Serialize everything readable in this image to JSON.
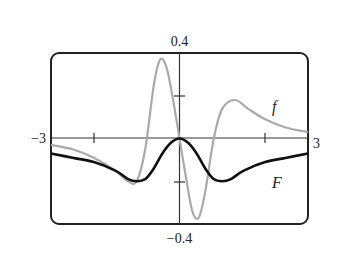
{
  "chart_data": {
    "type": "line",
    "title": "",
    "xlabel": "",
    "ylabel": "",
    "xlim": [
      -3,
      3
    ],
    "ylim": [
      -0.4,
      0.4
    ],
    "x_tick_labels": [
      "-3",
      "3"
    ],
    "y_tick_labels": [
      "0.4",
      "-0.4"
    ],
    "x_ticks": [
      -2,
      2
    ],
    "y_ticks": [
      -0.2,
      0.2
    ],
    "grid": false,
    "legend": "inline labels",
    "series": [
      {
        "name": "f",
        "color": "#aaaaaa",
        "x": [
          -3,
          -2.5,
          -2,
          -1.5,
          -1.2,
          -1,
          -0.8,
          -0.6,
          -0.45,
          -0.3,
          -0.15,
          0,
          0.15,
          0.3,
          0.45,
          0.6,
          0.8,
          1.0,
          1.3,
          1.6,
          2.0,
          2.5,
          3
        ],
        "values": [
          -0.03,
          -0.05,
          -0.09,
          -0.15,
          -0.2,
          -0.2,
          -0.05,
          0.25,
          0.37,
          0.33,
          0.18,
          0,
          -0.18,
          -0.34,
          -0.37,
          -0.25,
          0.0,
          0.14,
          0.18,
          0.14,
          0.09,
          0.05,
          0.03
        ]
      },
      {
        "name": "F",
        "color": "#111111",
        "x": [
          -3,
          -2.5,
          -2,
          -1.5,
          -1.2,
          -1,
          -0.8,
          -0.6,
          -0.4,
          -0.2,
          0,
          0.2,
          0.4,
          0.6,
          0.8,
          1,
          1.2,
          1.5,
          2,
          2.5,
          3
        ],
        "values": [
          -0.07,
          -0.09,
          -0.11,
          -0.15,
          -0.19,
          -0.2,
          -0.19,
          -0.14,
          -0.07,
          -0.02,
          0,
          -0.02,
          -0.07,
          -0.14,
          -0.19,
          -0.2,
          -0.19,
          -0.15,
          -0.11,
          -0.09,
          -0.07
        ]
      }
    ],
    "annotations": [
      "f",
      "F"
    ]
  },
  "labels": {
    "y_top": "0.4",
    "y_bottom": "−0.4",
    "x_left": "−3",
    "x_right": "3",
    "f_label": "f",
    "F_label": "F"
  }
}
